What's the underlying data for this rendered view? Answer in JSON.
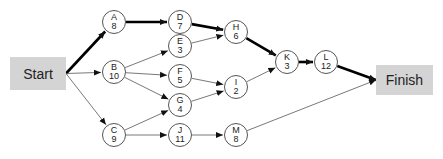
{
  "diagram": {
    "type": "activity-on-node network",
    "start": {
      "label": "Start",
      "x": 10,
      "y": 57,
      "w": 56,
      "h": 33
    },
    "finish": {
      "label": "Finish",
      "x": 376,
      "y": 65,
      "w": 57,
      "h": 30
    },
    "nodes": [
      {
        "id": "A",
        "duration": "8",
        "x": 114,
        "y": 22
      },
      {
        "id": "B",
        "duration": "10",
        "x": 114,
        "y": 72
      },
      {
        "id": "C",
        "duration": "9",
        "x": 114,
        "y": 135
      },
      {
        "id": "D",
        "duration": "7",
        "x": 180,
        "y": 22
      },
      {
        "id": "E",
        "duration": "3",
        "x": 180,
        "y": 46
      },
      {
        "id": "F",
        "duration": "5",
        "x": 180,
        "y": 76
      },
      {
        "id": "G",
        "duration": "4",
        "x": 180,
        "y": 105
      },
      {
        "id": "J",
        "duration": "11",
        "x": 180,
        "y": 135
      },
      {
        "id": "H",
        "duration": "6",
        "x": 236,
        "y": 32
      },
      {
        "id": "I",
        "duration": "2",
        "x": 236,
        "y": 87
      },
      {
        "id": "M",
        "duration": "8",
        "x": 236,
        "y": 135
      },
      {
        "id": "K",
        "duration": "3",
        "x": 287,
        "y": 62
      },
      {
        "id": "L",
        "duration": "12",
        "x": 326,
        "y": 62
      }
    ],
    "edges": [
      {
        "from": "Start",
        "to": "A",
        "critical": true
      },
      {
        "from": "Start",
        "to": "B",
        "critical": false
      },
      {
        "from": "Start",
        "to": "C",
        "critical": false
      },
      {
        "from": "A",
        "to": "D",
        "critical": true
      },
      {
        "from": "B",
        "to": "E",
        "critical": false
      },
      {
        "from": "B",
        "to": "F",
        "critical": false
      },
      {
        "from": "B",
        "to": "G",
        "critical": false
      },
      {
        "from": "C",
        "to": "G",
        "critical": false
      },
      {
        "from": "C",
        "to": "J",
        "critical": false
      },
      {
        "from": "D",
        "to": "H",
        "critical": true
      },
      {
        "from": "E",
        "to": "H",
        "critical": false
      },
      {
        "from": "F",
        "to": "I",
        "critical": false
      },
      {
        "from": "G",
        "to": "I",
        "critical": false
      },
      {
        "from": "J",
        "to": "M",
        "critical": false
      },
      {
        "from": "H",
        "to": "K",
        "critical": true
      },
      {
        "from": "I",
        "to": "K",
        "critical": false
      },
      {
        "from": "K",
        "to": "L",
        "critical": true
      },
      {
        "from": "L",
        "to": "Finish",
        "critical": true
      },
      {
        "from": "M",
        "to": "Finish",
        "critical": false
      }
    ],
    "critical_path": [
      "Start",
      "A",
      "D",
      "H",
      "K",
      "L",
      "Finish"
    ]
  }
}
